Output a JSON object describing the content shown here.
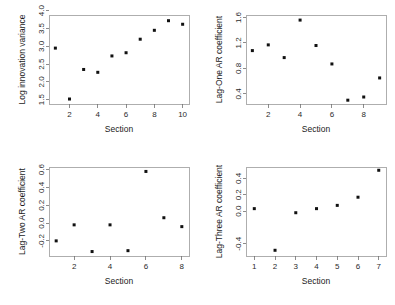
{
  "figure": {
    "background": "#ffffff",
    "point_color": "#111111",
    "axis_color": "#8a8a8a",
    "layout": "2x2 grid of scatter panels"
  },
  "chart_data": [
    {
      "type": "scatter",
      "title": "",
      "xlabel": "Section",
      "ylabel": "Log innovation variance",
      "x": [
        1,
        2,
        3,
        4,
        5,
        6,
        7,
        8,
        9,
        10
      ],
      "y": [
        2.95,
        1.52,
        2.35,
        2.27,
        2.73,
        2.82,
        3.2,
        3.45,
        3.72,
        3.62
      ],
      "xlim": [
        0.55,
        10.45
      ],
      "ylim": [
        1.38,
        3.88
      ],
      "xticks": [
        2,
        4,
        6,
        8,
        10
      ],
      "xticklabels": [
        "2",
        "4",
        "6",
        "8",
        "10"
      ],
      "yticks": [
        1.5,
        2.0,
        2.5,
        3.0,
        3.5,
        4.0
      ],
      "yticklabels": [
        "1.5",
        "2.0",
        "2.5",
        "3.0",
        "3.5",
        "4.0"
      ],
      "grid": false,
      "legend": "none"
    },
    {
      "type": "scatter",
      "title": "",
      "xlabel": "Section",
      "ylabel": "Lag-One AR coefficient",
      "x": [
        1,
        2,
        3,
        4,
        5,
        6,
        7,
        8,
        9
      ],
      "y": [
        1.08,
        1.17,
        0.97,
        1.56,
        1.16,
        0.87,
        0.3,
        0.35,
        0.65
      ],
      "xlim": [
        0.6,
        9.4
      ],
      "ylim": [
        0.24,
        1.64
      ],
      "xticks": [
        2,
        4,
        6,
        8
      ],
      "xticklabels": [
        "2",
        "4",
        "6",
        "8"
      ],
      "yticks": [
        0.4,
        0.8,
        1.2,
        1.6
      ],
      "yticklabels": [
        "0.4",
        "0.8",
        "1.2",
        "1.6"
      ],
      "grid": false,
      "legend": "none"
    },
    {
      "type": "scatter",
      "title": "",
      "xlabel": "Section",
      "ylabel": "Lag-Two AR coefficient",
      "x": [
        1,
        2,
        3,
        4,
        5,
        6,
        7,
        8
      ],
      "y": [
        -0.2,
        -0.02,
        -0.32,
        -0.02,
        -0.31,
        0.58,
        0.06,
        -0.04
      ],
      "xlim": [
        0.6,
        8.4
      ],
      "ylim": [
        -0.37,
        0.63
      ],
      "xticks": [
        2,
        4,
        6,
        8
      ],
      "xticklabels": [
        "2",
        "4",
        "6",
        "8"
      ],
      "yticks": [
        -0.2,
        0.0,
        0.2,
        0.4,
        0.6
      ],
      "yticklabels": [
        "-0.2",
        "0.0",
        "0.2",
        "0.4",
        "0.6"
      ],
      "grid": false,
      "legend": "none"
    },
    {
      "type": "scatter",
      "title": "",
      "xlabel": "Section",
      "ylabel": "Lag-Three AR coefficient",
      "x": [
        1,
        2,
        3,
        4,
        5,
        6,
        7
      ],
      "y": [
        0.03,
        -0.48,
        -0.02,
        0.03,
        0.07,
        0.17,
        0.5
      ],
      "xlim": [
        0.6,
        7.35
      ],
      "ylim": [
        -0.55,
        0.54
      ],
      "xticks": [
        1,
        2,
        3,
        4,
        5,
        6,
        7
      ],
      "xticklabels": [
        "1",
        "2",
        "3",
        "4",
        "5",
        "6",
        "7"
      ],
      "yticks": [
        -0.4,
        0.0,
        0.2,
        0.4
      ],
      "yticklabels": [
        "-0.4",
        "0.0",
        "0.2",
        "0.4"
      ],
      "grid": false,
      "legend": "none"
    }
  ]
}
